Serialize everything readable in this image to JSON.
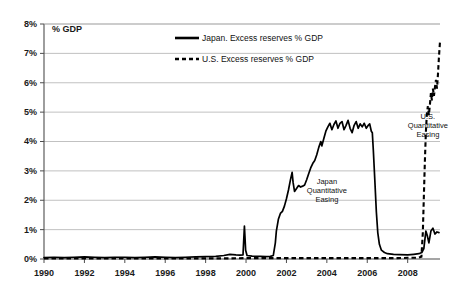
{
  "chart_data": {
    "type": "line",
    "title": "",
    "xlabel": "",
    "ylabel": "% GDP",
    "ylim": [
      0,
      8
    ],
    "xlim": [
      1990,
      2009.6
    ],
    "grid": true,
    "legend_position": "top-center",
    "ytick_labels": [
      "0%",
      "1%",
      "2%",
      "3%",
      "4%",
      "5%",
      "6%",
      "7%",
      "8%"
    ],
    "ytick_values": [
      0,
      1,
      2,
      3,
      4,
      5,
      6,
      7,
      8
    ],
    "xtick_labels": [
      "1990",
      "1992",
      "1994",
      "1996",
      "1998",
      "2000",
      "2002",
      "2004",
      "2006",
      "2008"
    ],
    "xtick_values": [
      1990,
      1992,
      1994,
      1996,
      1998,
      2000,
      2002,
      2004,
      2006,
      2008
    ],
    "annotations": [
      {
        "id": "japan-qe",
        "text_lines": [
          "Japan",
          "Quantitative",
          "Easing"
        ],
        "x": 2004.0,
        "y": 2.55
      },
      {
        "id": "us-qe",
        "text_lines": [
          "U.S.",
          "Quantitative",
          "Easing"
        ],
        "x": 2009.0,
        "y": 4.75
      }
    ],
    "series": [
      {
        "name": "Japan. Excess reserves % GDP",
        "key": "japan",
        "style": "solid",
        "color": "#000000",
        "points": [
          [
            1990.0,
            0.05
          ],
          [
            1990.5,
            0.06
          ],
          [
            1991.0,
            0.05
          ],
          [
            1991.5,
            0.06
          ],
          [
            1992.0,
            0.07
          ],
          [
            1992.5,
            0.06
          ],
          [
            1993.0,
            0.05
          ],
          [
            1993.5,
            0.06
          ],
          [
            1994.0,
            0.06
          ],
          [
            1994.5,
            0.05
          ],
          [
            1995.0,
            0.06
          ],
          [
            1995.5,
            0.07
          ],
          [
            1996.0,
            0.06
          ],
          [
            1996.5,
            0.05
          ],
          [
            1997.0,
            0.06
          ],
          [
            1997.5,
            0.07
          ],
          [
            1998.0,
            0.08
          ],
          [
            1998.5,
            0.09
          ],
          [
            1998.9,
            0.12
          ],
          [
            1999.2,
            0.16
          ],
          [
            1999.5,
            0.14
          ],
          [
            1999.7,
            0.13
          ],
          [
            1999.85,
            0.14
          ],
          [
            1999.92,
            1.12
          ],
          [
            1999.98,
            0.3
          ],
          [
            2000.05,
            0.12
          ],
          [
            2000.3,
            0.1
          ],
          [
            2000.7,
            0.09
          ],
          [
            2001.0,
            0.08
          ],
          [
            2001.2,
            0.09
          ],
          [
            2001.35,
            0.12
          ],
          [
            2001.45,
            0.55
          ],
          [
            2001.5,
            0.95
          ],
          [
            2001.6,
            1.35
          ],
          [
            2001.7,
            1.55
          ],
          [
            2001.8,
            1.62
          ],
          [
            2001.9,
            1.8
          ],
          [
            2002.0,
            2.05
          ],
          [
            2002.1,
            2.35
          ],
          [
            2002.2,
            2.7
          ],
          [
            2002.28,
            2.95
          ],
          [
            2002.33,
            2.6
          ],
          [
            2002.4,
            2.3
          ],
          [
            2002.5,
            2.4
          ],
          [
            2002.6,
            2.5
          ],
          [
            2002.7,
            2.45
          ],
          [
            2002.8,
            2.48
          ],
          [
            2002.9,
            2.52
          ],
          [
            2003.0,
            2.7
          ],
          [
            2003.1,
            2.9
          ],
          [
            2003.2,
            3.1
          ],
          [
            2003.3,
            3.25
          ],
          [
            2003.4,
            3.35
          ],
          [
            2003.5,
            3.55
          ],
          [
            2003.6,
            3.8
          ],
          [
            2003.7,
            4.0
          ],
          [
            2003.75,
            3.85
          ],
          [
            2003.85,
            4.1
          ],
          [
            2003.95,
            4.35
          ],
          [
            2004.05,
            4.5
          ],
          [
            2004.15,
            4.62
          ],
          [
            2004.25,
            4.4
          ],
          [
            2004.35,
            4.58
          ],
          [
            2004.45,
            4.7
          ],
          [
            2004.55,
            4.45
          ],
          [
            2004.65,
            4.62
          ],
          [
            2004.75,
            4.68
          ],
          [
            2004.85,
            4.4
          ],
          [
            2004.95,
            4.55
          ],
          [
            2005.05,
            4.72
          ],
          [
            2005.15,
            4.45
          ],
          [
            2005.25,
            4.3
          ],
          [
            2005.35,
            4.55
          ],
          [
            2005.45,
            4.68
          ],
          [
            2005.55,
            4.45
          ],
          [
            2005.65,
            4.6
          ],
          [
            2005.75,
            4.5
          ],
          [
            2005.85,
            4.62
          ],
          [
            2005.95,
            4.45
          ],
          [
            2006.05,
            4.55
          ],
          [
            2006.12,
            4.6
          ],
          [
            2006.2,
            4.35
          ],
          [
            2006.25,
            4.3
          ],
          [
            2006.3,
            3.7
          ],
          [
            2006.38,
            2.6
          ],
          [
            2006.45,
            1.6
          ],
          [
            2006.52,
            0.9
          ],
          [
            2006.6,
            0.5
          ],
          [
            2006.7,
            0.3
          ],
          [
            2006.85,
            0.22
          ],
          [
            2007.0,
            0.18
          ],
          [
            2007.3,
            0.16
          ],
          [
            2007.6,
            0.15
          ],
          [
            2008.0,
            0.14
          ],
          [
            2008.3,
            0.16
          ],
          [
            2008.55,
            0.18
          ],
          [
            2008.7,
            0.22
          ],
          [
            2008.8,
            0.35
          ],
          [
            2008.9,
            0.95
          ],
          [
            2008.97,
            0.8
          ],
          [
            2009.05,
            0.55
          ],
          [
            2009.15,
            0.95
          ],
          [
            2009.25,
            1.05
          ],
          [
            2009.35,
            0.85
          ],
          [
            2009.45,
            0.92
          ],
          [
            2009.55,
            0.9
          ]
        ]
      },
      {
        "name": "U.S. Excess reserves % GDP",
        "key": "us",
        "style": "dashed",
        "color": "#000000",
        "points": [
          [
            1990.0,
            0.02
          ],
          [
            1993.0,
            0.02
          ],
          [
            1996.0,
            0.02
          ],
          [
            1999.0,
            0.02
          ],
          [
            2000.0,
            0.03
          ],
          [
            2001.0,
            0.03
          ],
          [
            2002.0,
            0.03
          ],
          [
            2003.0,
            0.03
          ],
          [
            2004.0,
            0.03
          ],
          [
            2005.0,
            0.03
          ],
          [
            2006.0,
            0.03
          ],
          [
            2007.0,
            0.03
          ],
          [
            2007.5,
            0.03
          ],
          [
            2008.0,
            0.04
          ],
          [
            2008.3,
            0.04
          ],
          [
            2008.55,
            0.05
          ],
          [
            2008.68,
            0.08
          ],
          [
            2008.75,
            0.9
          ],
          [
            2008.8,
            2.1
          ],
          [
            2008.85,
            3.3
          ],
          [
            2008.9,
            4.3
          ],
          [
            2008.95,
            4.95
          ],
          [
            2009.0,
            5.2
          ],
          [
            2009.05,
            4.9
          ],
          [
            2009.1,
            5.25
          ],
          [
            2009.15,
            5.65
          ],
          [
            2009.2,
            5.4
          ],
          [
            2009.25,
            5.8
          ],
          [
            2009.3,
            5.55
          ],
          [
            2009.35,
            5.85
          ],
          [
            2009.4,
            6.1
          ],
          [
            2009.45,
            5.8
          ],
          [
            2009.5,
            6.3
          ],
          [
            2009.55,
            6.9
          ],
          [
            2009.6,
            7.4
          ]
        ]
      }
    ]
  },
  "legend": {
    "items": [
      {
        "label": "Japan. Excess reserves % GDP",
        "style": "solid"
      },
      {
        "label": "U.S. Excess reserves % GDP",
        "style": "dashed"
      }
    ]
  }
}
